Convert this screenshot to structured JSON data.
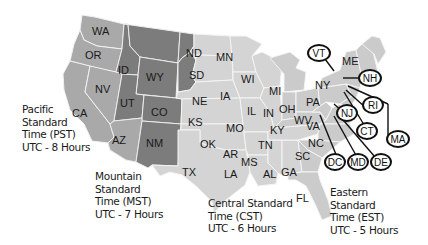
{
  "map": {
    "title": "US Time Zones",
    "colors": {
      "pacific": "#a9a9a9",
      "mountain": "#7c7c7c",
      "central": "#d4d4d4",
      "eastern": "#cbcbcb",
      "border": "#f4f4f4",
      "callout_stroke": "#111111"
    },
    "states": {
      "WA": "WA",
      "OR": "OR",
      "CA": "CA",
      "NV": "NV",
      "ID": "ID",
      "WY": "WY",
      "UT": "UT",
      "CO": "CO",
      "AZ": "AZ",
      "NM": "NM",
      "ND": "ND",
      "SD": "SD",
      "NE": "NE",
      "KS": "KS",
      "OK": "OK",
      "TX": "TX",
      "MN": "MN",
      "IA": "IA",
      "MO": "MO",
      "AR": "AR",
      "LA": "LA",
      "WI": "WI",
      "IL": "IL",
      "MS": "MS",
      "AL": "AL",
      "TN": "TN",
      "MI": "MI",
      "IN": "IN",
      "OH": "OH",
      "KY": "KY",
      "WV": "WV",
      "VA": "VA",
      "NC": "NC",
      "SC": "SC",
      "GA": "GA",
      "FL": "FL",
      "PA": "PA",
      "NY": "NY",
      "ME": "ME"
    },
    "callouts": {
      "VT": "VT",
      "NH": "NH",
      "NJ": "NJ",
      "RI": "RI",
      "CT": "CT",
      "MA": "MA",
      "DC": "DC",
      "MD": "MD",
      "DE": "DE"
    },
    "zones": {
      "pacific": {
        "line1": "Pacific",
        "line2": "Standard",
        "line3": "Time (PST)",
        "line4": "UTC - 8 Hours"
      },
      "mountain": {
        "line1": "Mountain",
        "line2": "Standard",
        "line3": "Time (MST)",
        "line4": "UTC - 7 Hours"
      },
      "central": {
        "line1": "Central Standard",
        "line2": "Time (CST)",
        "line3": "UTC - 6 Hours"
      },
      "eastern": {
        "line1": "Eastern",
        "line2": "Standard",
        "line3": "Time (EST)",
        "line4": "UTC - 5 Hours"
      }
    }
  }
}
